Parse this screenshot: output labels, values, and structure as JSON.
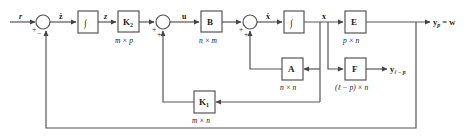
{
  "diagram": {
    "type": "control-system-block-diagram",
    "signals": {
      "r": "r",
      "e": "ż",
      "z": "z",
      "u": "u",
      "xdot": "ẋ",
      "x": "x",
      "yp": "y",
      "yp_sub": "p",
      "yp_eq": "= w",
      "yrest": "y",
      "yrest_sub": "ℓ − p"
    },
    "blocks": {
      "integrator1": {
        "label": "∫"
      },
      "K2": {
        "label": "K",
        "sub": "2",
        "dim": "m × p"
      },
      "B": {
        "label": "B",
        "dim": "n × m"
      },
      "integrator2": {
        "label": "∫"
      },
      "E": {
        "label": "E",
        "dim": "p × n"
      },
      "F": {
        "label": "F",
        "dim": "(ℓ − p) × n"
      },
      "A": {
        "label": "A",
        "dim": "n × n"
      },
      "K1": {
        "label": "K",
        "sub": "1",
        "dim": "m × n"
      }
    },
    "summing_junctions": {
      "sum1": {
        "signs": [
          "+",
          "−"
        ]
      },
      "sum2": {
        "signs": [
          "+",
          "+"
        ]
      },
      "sum3": {
        "signs": [
          "+",
          "+"
        ]
      }
    },
    "colors": {
      "line": "#555555",
      "text": "#222222",
      "background": "#ffffff"
    }
  }
}
